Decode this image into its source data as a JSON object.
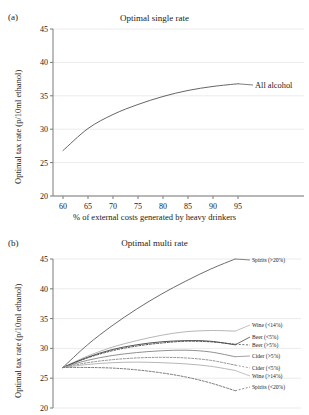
{
  "figure": {
    "panel_a": {
      "letter": "(a)",
      "title": "Optimal single rate",
      "ylabel": "Optimal tax rate (p/10ml ethanol)",
      "xlabel": "% of external costs generated by heavy drinkers"
    },
    "panel_b": {
      "letter": "(b)",
      "title": "Optimal multi rate",
      "ylabel": "Optimal tax rate (p/10ml ethanol)"
    }
  },
  "chart_data": [
    {
      "id": "panel_a",
      "type": "line",
      "title": "Optimal single rate",
      "xlabel": "% of external costs generated by heavy drinkers",
      "ylabel": "Optimal tax rate (p/10ml ethanol)",
      "xlim": [
        58,
        97
      ],
      "ylim": [
        20,
        45
      ],
      "xticks": [
        60,
        65,
        70,
        75,
        80,
        85,
        90,
        95
      ],
      "yticks": [
        20,
        25,
        30,
        35,
        40,
        45
      ],
      "grid": "horizontal",
      "legend_position": "inline-right",
      "x": [
        60,
        65,
        70,
        75,
        80,
        85,
        90,
        95
      ],
      "series": [
        {
          "name": "All alcohol",
          "color": "#5d5d5d",
          "dash": "solid",
          "values": [
            26.8,
            30.1,
            32.2,
            33.7,
            34.9,
            35.8,
            36.4,
            36.8
          ]
        }
      ]
    },
    {
      "id": "panel_b",
      "type": "line",
      "title": "Optimal multi rate",
      "xlabel": "",
      "ylabel": "Optimal tax rate (p/10ml ethanol)",
      "xlim": [
        58,
        97
      ],
      "ylim": [
        20,
        45
      ],
      "xticks": [
        60,
        65,
        70,
        75,
        80,
        85,
        90,
        95
      ],
      "yticks": [
        20,
        25,
        30,
        35,
        40,
        45
      ],
      "grid": "horizontal",
      "legend_position": "inline-right",
      "x": [
        60,
        65,
        70,
        75,
        80,
        85,
        90,
        95
      ],
      "series": [
        {
          "name": "Spirits (>20%)",
          "color": "#646464",
          "dash": "solid",
          "values": [
            26.8,
            30.6,
            33.8,
            36.6,
            39.1,
            41.3,
            43.3,
            45.0
          ]
        },
        {
          "name": "Wine (<14%)",
          "color": "#b2b2b2",
          "dash": "solid",
          "values": [
            26.8,
            28.7,
            30.2,
            31.3,
            32.2,
            32.8,
            33.0,
            32.9
          ]
        },
        {
          "name": "Beer (<5%)",
          "color": "#4a4a4a",
          "dash": "solid",
          "values": [
            26.8,
            28.5,
            29.8,
            30.6,
            31.1,
            31.3,
            31.2,
            30.6
          ]
        },
        {
          "name": "Beer (>5%)",
          "color": "#4a4a4a",
          "dash": "dashed",
          "values": [
            26.8,
            28.4,
            29.6,
            30.4,
            30.9,
            31.2,
            31.1,
            30.7
          ]
        },
        {
          "name": "Cider (>5%)",
          "color": "#8a8a8a",
          "dash": "solid",
          "values": [
            26.8,
            28.0,
            28.8,
            29.3,
            29.6,
            29.7,
            29.4,
            28.6
          ]
        },
        {
          "name": "Cider (<5%)",
          "color": "#8a8a8a",
          "dash": "dashed",
          "values": [
            26.8,
            27.6,
            28.1,
            28.4,
            28.5,
            28.4,
            28.0,
            27.2
          ]
        },
        {
          "name": "Wine (>14%)",
          "color": "#b2b2b2",
          "dash": "solid",
          "values": [
            26.8,
            27.3,
            27.6,
            27.7,
            27.6,
            27.4,
            27.0,
            26.3
          ]
        },
        {
          "name": "Spirits (<20%)",
          "color": "#6e6e6e",
          "dash": "dashed",
          "values": [
            26.8,
            26.8,
            26.7,
            26.4,
            25.9,
            25.2,
            24.2,
            22.9
          ]
        }
      ]
    }
  ]
}
